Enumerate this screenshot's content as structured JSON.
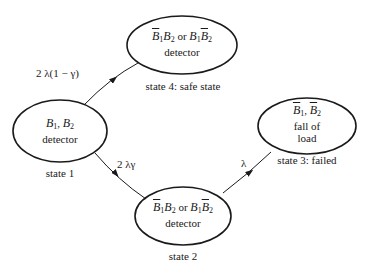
{
  "diagram": {
    "type": "state-transition (Markov) diagram",
    "states": [
      {
        "id": "state1",
        "line1_parts": [
          {
            "t": "B",
            "sub": "1",
            "bar": false
          },
          {
            "sep": ", "
          },
          {
            "t": "B",
            "sub": "2",
            "bar": false
          }
        ],
        "line1": "B1, B2",
        "line2": "detector",
        "caption": "state 1"
      },
      {
        "id": "state4",
        "line1": "B̄1B2 or B1B̄2",
        "line2": "detector",
        "caption": "state 4: safe state"
      },
      {
        "id": "state2",
        "line1": "B̄1B2 or B1B̄2",
        "line2": "detector",
        "caption": "state 2"
      },
      {
        "id": "state3",
        "line1": "B̄1, B̄2",
        "line2": "fall of",
        "line3": "load",
        "caption": "state 3: failed"
      }
    ],
    "transitions": [
      {
        "from": "state 1",
        "to": "state 4",
        "rate": "2 λ(1 − γ)"
      },
      {
        "from": "state 1",
        "to": "state 2",
        "rate": "2 λγ"
      },
      {
        "from": "state 2",
        "to": "state 3",
        "rate": "λ"
      }
    ],
    "symbols": {
      "B": "B",
      "or": "or",
      "sub1": "1",
      "sub2": "2",
      "comma": ", "
    },
    "stroke_color": "#1a1a1a"
  }
}
